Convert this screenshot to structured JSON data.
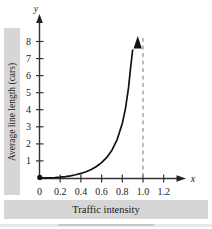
{
  "chart_data": {
    "type": "line",
    "title": "",
    "xlabel": "Traffic intensity",
    "ylabel": "Average line length (cars)",
    "x_axis_name": "x",
    "y_axis_name": "y",
    "xlim": [
      0,
      1.3
    ],
    "ylim": [
      0,
      8.6
    ],
    "xticks": [
      "0",
      "0.2",
      "0.4",
      "0.6",
      "0.8",
      "1.0",
      "1.2"
    ],
    "xtick_values": [
      0,
      0.2,
      0.4,
      0.6,
      0.8,
      1.0,
      1.2
    ],
    "yticks": [
      "1",
      "2",
      "3",
      "4",
      "5",
      "6",
      "7",
      "8"
    ],
    "ytick_values": [
      1,
      2,
      3,
      4,
      5,
      6,
      7,
      8
    ],
    "grid": false,
    "legend": null,
    "series": [
      {
        "name": "Average line length",
        "note": "y = x^2 / (1 - x), vertical asymptote at x = 1",
        "x": [
          0.0,
          0.05,
          0.1,
          0.15,
          0.2,
          0.25,
          0.3,
          0.35,
          0.4,
          0.45,
          0.5,
          0.55,
          0.6,
          0.65,
          0.7,
          0.75,
          0.8,
          0.83,
          0.86,
          0.88,
          0.9,
          0.91,
          0.92,
          0.93,
          0.94,
          0.945
        ],
        "y": [
          0.0,
          0.003,
          0.011,
          0.026,
          0.05,
          0.083,
          0.129,
          0.188,
          0.267,
          0.368,
          0.5,
          0.672,
          0.9,
          1.207,
          1.633,
          2.25,
          3.2,
          4.052,
          5.277,
          6.453,
          8.1,
          9.192,
          10.58,
          12.356,
          14.727,
          16.228
        ]
      }
    ],
    "annotations": [
      {
        "kind": "asymptote",
        "orientation": "vertical",
        "x": 1.0,
        "style": "dashed",
        "color": "#9a9a9a"
      },
      {
        "kind": "point-marker",
        "x": 0,
        "y": 0,
        "style": "filled-dot",
        "color": "#111111"
      },
      {
        "kind": "arrowhead",
        "on": "curve-end",
        "direction": "up"
      }
    ],
    "colors": {
      "curve": "#111111",
      "axis": "#333333",
      "asymptote": "#9a9a9a",
      "label_band": "#d6d6d6",
      "text": "#1b1b1b",
      "background": "#ffffff"
    }
  },
  "figure": {
    "y_axis_title": "Average line length (cars)",
    "x_axis_title": "Traffic intensity",
    "x_axis_symbol": "x",
    "y_axis_symbol": "y",
    "xtick_0": "0",
    "xtick_1": "0.2",
    "xtick_2": "0.4",
    "xtick_3": "0.6",
    "xtick_4": "0.8",
    "xtick_5": "1.0",
    "xtick_6": "1.2",
    "ytick_1": "1",
    "ytick_2": "2",
    "ytick_3": "3",
    "ytick_4": "4",
    "ytick_5": "5",
    "ytick_6": "6",
    "ytick_7": "7",
    "ytick_8": "8"
  }
}
